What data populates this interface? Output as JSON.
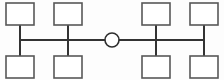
{
  "diagram": {
    "type": "bus-hub topology",
    "background_color": "#fdfdfd",
    "box_stroke_color": "#585858",
    "box_fill_color": "#ffffff",
    "line_color": "#333333",
    "hub": {
      "name": "central-hub",
      "shape": "circle",
      "cx": 112,
      "cy": 40,
      "r": 7,
      "label": ""
    },
    "nodes": [
      {
        "id": "node-top-left-1",
        "label": "",
        "x": 6,
        "y": 3,
        "w": 28,
        "h": 22,
        "stem_x": 20,
        "stem_y1": 25,
        "stem_y2": 40
      },
      {
        "id": "node-top-left-2",
        "label": "",
        "x": 54,
        "y": 3,
        "w": 28,
        "h": 22,
        "stem_x": 68,
        "stem_y1": 25,
        "stem_y2": 40
      },
      {
        "id": "node-top-right-1",
        "label": "",
        "x": 142,
        "y": 3,
        "w": 28,
        "h": 22,
        "stem_x": 156,
        "stem_y1": 25,
        "stem_y2": 40
      },
      {
        "id": "node-top-right-2",
        "label": "",
        "x": 190,
        "y": 3,
        "w": 28,
        "h": 22,
        "stem_x": 204,
        "stem_y1": 25,
        "stem_y2": 40
      },
      {
        "id": "node-bottom-left-1",
        "label": "",
        "x": 6,
        "y": 56,
        "w": 28,
        "h": 22,
        "stem_x": 20,
        "stem_y1": 40,
        "stem_y2": 56
      },
      {
        "id": "node-bottom-left-2",
        "label": "",
        "x": 54,
        "y": 56,
        "w": 28,
        "h": 22,
        "stem_x": 68,
        "stem_y1": 40,
        "stem_y2": 56
      },
      {
        "id": "node-bottom-right-1",
        "label": "",
        "x": 142,
        "y": 56,
        "w": 28,
        "h": 22,
        "stem_x": 156,
        "stem_y1": 40,
        "stem_y2": 56
      },
      {
        "id": "node-bottom-right-2",
        "label": "",
        "x": 190,
        "y": 56,
        "w": 28,
        "h": 22,
        "stem_x": 204,
        "stem_y1": 40,
        "stem_y2": 56
      }
    ],
    "buses": [
      {
        "id": "bus-left",
        "x1": 20,
        "y1": 40,
        "x2": 105,
        "y2": 40
      },
      {
        "id": "bus-right",
        "x1": 119,
        "y1": 40,
        "x2": 204,
        "y2": 40
      }
    ]
  }
}
